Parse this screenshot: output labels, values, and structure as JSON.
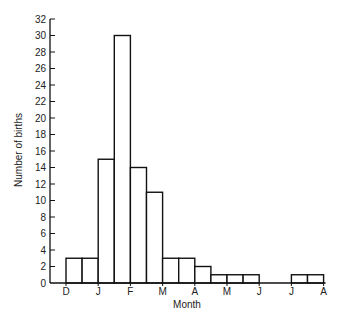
{
  "chart_data": {
    "type": "bar",
    "title": "",
    "xlabel": "Month",
    "ylabel": "Number of births",
    "ylim": [
      0,
      32
    ],
    "yticks": [
      0,
      2,
      4,
      6,
      8,
      10,
      12,
      14,
      16,
      18,
      20,
      22,
      24,
      26,
      28,
      30,
      32
    ],
    "xtick_labels": [
      "D",
      "J",
      "F",
      "M",
      "A",
      "M",
      "J",
      "J",
      "A"
    ],
    "bins_per_month": 2,
    "categories": [
      "Dec 1st half",
      "Dec 2nd half",
      "Jan 1st half",
      "Jan 2nd half",
      "Feb 1st half",
      "Feb 2nd half",
      "Mar 1st half",
      "Mar 2nd half",
      "Apr 1st half",
      "Apr 2nd half",
      "May 1st half",
      "May 2nd half",
      "Jun 1st half",
      "Jun 2nd half",
      "Jul 1st half",
      "Jul 2nd half"
    ],
    "values": [
      3,
      3,
      15,
      30,
      14,
      11,
      3,
      3,
      2,
      1,
      1,
      1,
      0,
      0,
      1,
      1
    ],
    "grid": false,
    "legend": null,
    "style": {
      "bar_fill": "#ffffff",
      "bar_stroke": "#111111",
      "axis_color": "#111111"
    }
  }
}
